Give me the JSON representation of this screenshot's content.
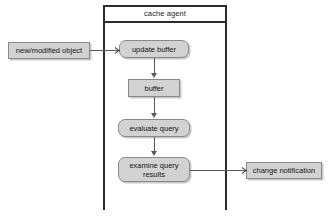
{
  "diagram": {
    "container": {
      "title": "cache agent"
    },
    "nodes": [
      {
        "id": "new-modified-object",
        "label": "new/modified object",
        "shape": "sharp",
        "fill": "#d2d2d2"
      },
      {
        "id": "update-buffer",
        "label": "update buffer",
        "shape": "rounded",
        "fill": "#d2d2d2"
      },
      {
        "id": "buffer",
        "label": "buffer",
        "shape": "sharp",
        "fill": "#d2d2d2"
      },
      {
        "id": "evaluate-query",
        "label": "evaluate query",
        "shape": "rounded",
        "fill": "#d2d2d2"
      },
      {
        "id": "examine-query-results",
        "label_line1": "examine query",
        "label_line2": "results",
        "shape": "rounded",
        "fill": "#d2d2d2"
      },
      {
        "id": "change-notification",
        "label": "change notification",
        "shape": "sharp",
        "fill": "#d2d2d2"
      }
    ],
    "edges": [
      {
        "from": "new-modified-object",
        "to": "update-buffer",
        "direction": "right",
        "arrowhead": "open"
      },
      {
        "from": "update-buffer",
        "to": "buffer",
        "direction": "down",
        "arrowhead": "solid"
      },
      {
        "from": "buffer",
        "to": "evaluate-query",
        "direction": "down",
        "arrowhead": "solid"
      },
      {
        "from": "evaluate-query",
        "to": "examine-query-results",
        "direction": "down",
        "arrowhead": "solid"
      },
      {
        "from": "examine-query-results",
        "to": "change-notification",
        "direction": "right",
        "arrowhead": "open"
      }
    ],
    "colors": {
      "node_fill": "#d2d2d2",
      "node_border": "#8a8a8a",
      "frame_border": "#2b2b2b",
      "connector": "#5a5a5a",
      "background": "#ffffff",
      "text": "#151515"
    }
  }
}
